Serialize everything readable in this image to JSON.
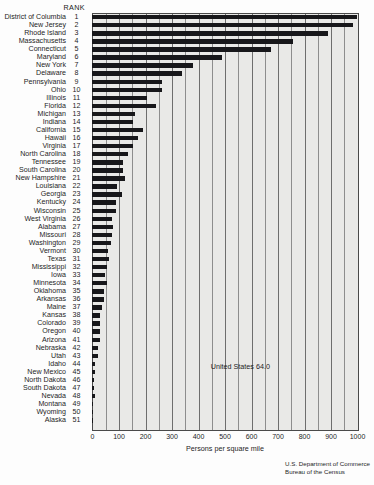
{
  "header": {
    "rank_label": "RANK"
  },
  "axis": {
    "xlabel": "Persons per square mile",
    "ticks": [
      "0",
      "100",
      "200",
      "300",
      "400",
      "500",
      "600",
      "700",
      "800",
      "900",
      "1000"
    ]
  },
  "annotation": {
    "us_average": "United States  64.0"
  },
  "source": {
    "line1": "U.S. Department of Commerce",
    "line2": "Bureau of the Census"
  },
  "chart_data": {
    "type": "bar",
    "orientation": "horizontal",
    "title": "",
    "xlabel": "Persons per square mile",
    "ylabel": "",
    "xlim": [
      0,
      1000
    ],
    "grid": true,
    "gridline_interval": 50,
    "legend": "none",
    "annotations": [
      "United States  64.0"
    ],
    "columns": [
      "State",
      "Rank",
      "Persons per square mile"
    ],
    "categories": [
      "District of Columbia",
      "New Jersey",
      "Rhode Island",
      "Massachusetts",
      "Connecticut",
      "Maryland",
      "New York",
      "Delaware",
      "Pennsylvania",
      "Ohio",
      "Illinois",
      "Florida",
      "Michigan",
      "Indiana",
      "California",
      "Hawaii",
      "Virginia",
      "North Carolina",
      "Tennessee",
      "South Carolina",
      "New Hampshire",
      "Louisiana",
      "Georgia",
      "Kentucky",
      "Wisconsin",
      "West Virginia",
      "Alabama",
      "Missouri",
      "Washington",
      "Vermont",
      "Texas",
      "Mississippi",
      "Iowa",
      "Minnesota",
      "Oklahoma",
      "Arkansas",
      "Maine",
      "Kansas",
      "Colorado",
      "Oregon",
      "Arizona",
      "Nebraska",
      "Utah",
      "Idaho",
      "New Mexico",
      "North Dakota",
      "South Dakota",
      "Nevada",
      "Montana",
      "Wyoming",
      "Alaska"
    ],
    "ranks": [
      1,
      2,
      3,
      4,
      5,
      6,
      7,
      8,
      9,
      10,
      11,
      12,
      13,
      14,
      15,
      16,
      17,
      18,
      19,
      20,
      21,
      22,
      23,
      24,
      25,
      26,
      27,
      28,
      29,
      30,
      31,
      32,
      33,
      34,
      35,
      36,
      37,
      38,
      39,
      40,
      41,
      42,
      43,
      44,
      45,
      46,
      47,
      48,
      49,
      50,
      51
    ],
    "values": [
      9883,
      1042,
      960,
      768,
      678,
      489,
      381,
      341,
      265,
      264,
      206,
      240,
      163,
      154,
      191,
      173,
      156,
      136,
      118,
      116,
      124,
      96,
      112,
      92,
      90,
      75,
      80,
      75,
      73,
      61,
      65,
      55,
      50,
      55,
      45,
      45,
      39,
      31,
      31,
      29,
      32,
      21,
      21,
      12,
      13,
      9,
      9,
      11,
      5.5,
      4.7,
      1.0
    ],
    "bar_display_values": [
      1000,
      985,
      890,
      760,
      675,
      490,
      380,
      340,
      265,
      264,
      206,
      240,
      163,
      154,
      191,
      173,
      156,
      136,
      118,
      116,
      124,
      96,
      112,
      92,
      90,
      75,
      80,
      75,
      73,
      61,
      65,
      55,
      50,
      55,
      45,
      45,
      39,
      31,
      31,
      29,
      32,
      21,
      21,
      12,
      13,
      9,
      9,
      11,
      5.5,
      4.7,
      1.0
    ]
  }
}
